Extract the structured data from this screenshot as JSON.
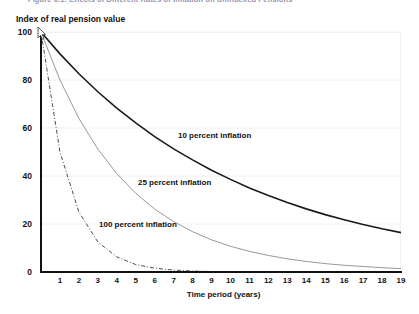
{
  "figure": {
    "title": "Figure 6.1: Effects of Different Rates of Inflation on Unindexed Pensions"
  },
  "axes": {
    "ylabel": "Index of real pension value",
    "xlabel": "Time period (years)",
    "yticks": [
      "0",
      "20",
      "40",
      "60",
      "80",
      "100"
    ],
    "xticks": [
      "1",
      "2",
      "3",
      "4",
      "5",
      "6",
      "7",
      "8",
      "9",
      "10",
      "11",
      "12",
      "13",
      "14",
      "15",
      "16",
      "17",
      "18",
      "19"
    ]
  },
  "series_labels": {
    "s10": "10 percent inflation",
    "s25": "25 percent inflation",
    "s100": "100 percent inflation"
  },
  "colors": {
    "line_10": "#1a1a1a",
    "line_25": "#8c8c8c",
    "line_100": "#4d4d4d",
    "grid": "#f0f0f0",
    "axis": "#111111",
    "title": "#3a3a6a"
  },
  "chart_data": {
    "type": "line",
    "title": "Figure 6.1: Effects of Different Rates of Inflation on Unindexed Pensions",
    "xlabel": "Time period (years)",
    "ylabel": "Index of real pension value",
    "xlim": [
      0,
      19
    ],
    "ylim": [
      0,
      100
    ],
    "grid": true,
    "legend": "inline-annotations",
    "x": [
      0,
      1,
      2,
      3,
      4,
      5,
      6,
      7,
      8,
      9,
      10,
      11,
      12,
      13,
      14,
      15,
      16,
      17,
      18,
      19
    ],
    "series": [
      {
        "name": "10 percent inflation",
        "style": "solid",
        "color": "#1a1a1a",
        "values": [
          100,
          90.9,
          82.6,
          75.1,
          68.3,
          62.1,
          56.4,
          51.3,
          46.7,
          42.4,
          38.6,
          35.0,
          31.9,
          29.0,
          26.3,
          23.9,
          21.8,
          19.8,
          18.0,
          16.4
        ]
      },
      {
        "name": "25 percent inflation",
        "style": "thin-solid",
        "color": "#8c8c8c",
        "values": [
          100,
          80.0,
          64.0,
          51.2,
          41.0,
          32.8,
          26.2,
          21.0,
          16.8,
          13.4,
          10.7,
          8.6,
          6.9,
          5.5,
          4.4,
          3.5,
          2.8,
          2.3,
          1.8,
          1.4
        ]
      },
      {
        "name": "100 percent inflation",
        "style": "dash-dot",
        "color": "#4d4d4d",
        "values": [
          100,
          50.0,
          25.0,
          12.5,
          6.3,
          3.1,
          1.6,
          0.8,
          0.4,
          0.2,
          0.1,
          0.05,
          0.02,
          0.01,
          0.0,
          0.0,
          0.0,
          0.0,
          0.0,
          0.0
        ]
      }
    ]
  }
}
